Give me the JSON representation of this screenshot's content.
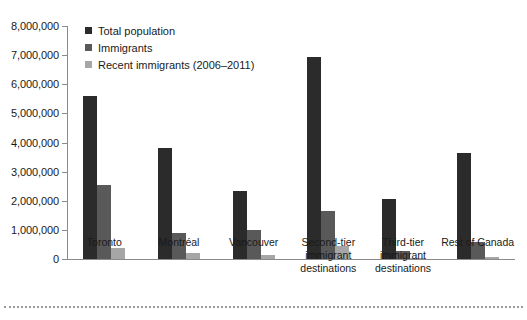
{
  "chart_data": {
    "type": "bar",
    "title": "",
    "xlabel": "",
    "ylabel": "",
    "ylim": [
      0,
      8000000
    ],
    "ytick_interval": 1000000,
    "ytick_labels": [
      "8,000,000",
      "7,000,000",
      "6,000,000",
      "5,000,000",
      "4,000,000",
      "3,000,000",
      "2,000,000",
      "1,000,000",
      "0"
    ],
    "ytick_values": [
      8000000,
      7000000,
      6000000,
      5000000,
      4000000,
      3000000,
      2000000,
      1000000,
      0
    ],
    "grid": false,
    "legend_position": "top-left",
    "categories": [
      "Toronto",
      "Montréal",
      "Vancouver",
      "Second-tier\nimmigrant\ndestinations",
      "Third-tier\nimmigrant\ndestinations",
      "Rest of Canada"
    ],
    "series": [
      {
        "name": "Total population",
        "color": "#2b2b2b",
        "values": [
          5580000,
          3800000,
          2330000,
          6930000,
          2050000,
          3650000
        ]
      },
      {
        "name": "Immigrants",
        "color": "#595959",
        "values": [
          2540000,
          900000,
          1000000,
          1640000,
          280000,
          580000
        ]
      },
      {
        "name": "Recent immigrants (2006–2011)",
        "color": "#a6a6a6",
        "values": [
          380000,
          190000,
          130000,
          440000,
          50000,
          60000
        ]
      }
    ]
  },
  "axis": {
    "y_ticks": [
      {
        "label": "8,000,000",
        "value": 8000000
      },
      {
        "label": "7,000,000",
        "value": 7000000
      },
      {
        "label": "6,000,000",
        "value": 6000000
      },
      {
        "label": "5,000,000",
        "value": 5000000
      },
      {
        "label": "4,000,000",
        "value": 4000000
      },
      {
        "label": "3,000,000",
        "value": 3000000
      },
      {
        "label": "2,000,000",
        "value": 2000000
      },
      {
        "label": "1,000,000",
        "value": 1000000
      },
      {
        "label": "0",
        "value": 0
      }
    ]
  },
  "legend": {
    "items": [
      {
        "label": "Total population",
        "color": "#2b2b2b"
      },
      {
        "label": "Immigrants",
        "color": "#595959"
      },
      {
        "label": "Recent immigrants (2006–2011)",
        "color": "#a6a6a6"
      }
    ]
  }
}
